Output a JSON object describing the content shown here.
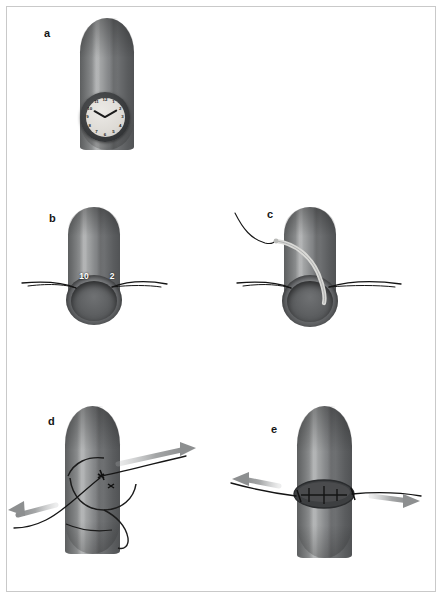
{
  "figure": {
    "background_color": "#ffffff",
    "frame_color": "#c9c9c9",
    "tube_colors": {
      "dark": "#515355",
      "mid": "#7c7e7f",
      "highlight": "#a9abac",
      "lumen": "#5c5e60"
    },
    "suture_color": "#1a1a1a",
    "arrow_color": "#9a9c9d",
    "needle_color": "#d9d9d6"
  },
  "panels": [
    {
      "id": "a",
      "label": "a",
      "caption": "Tubular structure with clock-face orientation reference",
      "objects": [
        "tube",
        "clock-face"
      ]
    },
    {
      "id": "b",
      "label": "b",
      "caption": "Stay sutures placed at the 10 o'clock and 2 o'clock positions",
      "objects": [
        "tube",
        "cut-end",
        "stay-suture-left",
        "stay-suture-right"
      ],
      "markers": [
        {
          "text": "10",
          "position": "10-oclock"
        },
        {
          "text": "2",
          "position": "2-oclock"
        }
      ]
    },
    {
      "id": "c",
      "label": "c",
      "caption": "Curved needle with suture passed through the wall",
      "objects": [
        "tube",
        "cut-end",
        "curved-needle",
        "suture-thread",
        "stay-suture-left",
        "stay-suture-right"
      ]
    },
    {
      "id": "d",
      "label": "d",
      "caption": "Suture loops drawn taut in opposing directions",
      "objects": [
        "tube",
        "suture-loop",
        "knot",
        "arrow-upper-right",
        "arrow-lower-left"
      ]
    },
    {
      "id": "e",
      "label": "e",
      "caption": "Completed closure with sutures tensioned laterally",
      "objects": [
        "tube",
        "closed-opening",
        "stitch-line",
        "arrow-left",
        "arrow-right"
      ]
    }
  ],
  "clock": {
    "numerals": [
      "12",
      "1",
      "2",
      "3",
      "4",
      "5",
      "6",
      "7",
      "8",
      "9",
      "10",
      "11"
    ],
    "hour_hand_points_to": "10",
    "minute_hand_points_to": "2",
    "face_color": "#dedbd6",
    "bezel_color": "#3a3c3e"
  }
}
